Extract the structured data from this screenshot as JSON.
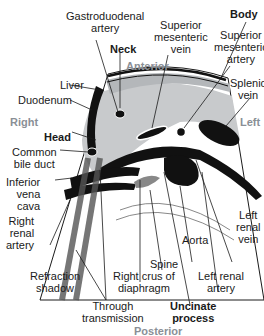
{
  "diagram": {
    "type": "anatomical-ultrasound-cross-section",
    "orientation": {
      "anterior": "Anterior",
      "posterior": "Posterior",
      "right": "Right",
      "left": "Left"
    },
    "labels": {
      "gastroduodenal_artery": "Gastroduodenal artery",
      "gda_line1": "Gastroduodenal",
      "gda_line2": "artery",
      "neck": "Neck",
      "body": "Body",
      "smv_line1": "Superior",
      "smv_line2": "mesenteric",
      "smv_line3": "vein",
      "sma_line1": "Superior",
      "sma_line2": "mesenteric",
      "sma_line3": "artery",
      "splenic_vein_line1": "Splenic",
      "splenic_vein_line2": "vein",
      "liver": "Liver",
      "duodenum": "Duodenum",
      "head": "Head",
      "cbd_line1": "Common",
      "cbd_line2": "bile duct",
      "ivc_line1": "Inferior",
      "ivc_line2": "vena",
      "ivc_line3": "cava",
      "rra_line1": "Right",
      "rra_line2": "renal",
      "rra_line3": "artery",
      "lrv_line1": "Left",
      "lrv_line2": "renal",
      "lrv_line3": "vein",
      "aorta": "Aorta",
      "spine": "Spine",
      "crus_line1": "Right crus of",
      "crus_line2": "diaphragm",
      "lra_line1": "Left renal",
      "lra_line2": "artery",
      "refraction_line1": "Refraction",
      "refraction_line2": "shadow",
      "through_line1": "Through",
      "through_line2": "transmission",
      "uncinate_line1": "Uncinate",
      "uncinate_line2": "process"
    },
    "colors": {
      "pancreas": "#c8cacc",
      "liver": "#b4b7ba",
      "vessel": "#111111",
      "direction_text": "#8a8f96",
      "line": "#1a1a1a"
    }
  }
}
